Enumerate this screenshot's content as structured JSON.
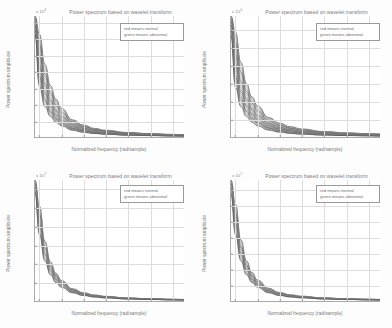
{
  "figure": {
    "layout": "2x2 subplot grid",
    "background_color": "#fdfdfd",
    "curve_color": "#4a4a4a",
    "grid_color": "#dcdcdc",
    "axis_color": "#a9a9a9",
    "text_color": "#7b7b7b"
  },
  "common": {
    "title": "Power spectrum based on wavelet transform",
    "xlabel": "Normalized frequency (rad/sample)",
    "ylabel": "Power spectrum amplitude",
    "legend": {
      "line1": "red means normal",
      "line2": "green means abnormal"
    }
  },
  "chart_data": [
    {
      "type": "line",
      "panel": "top-left",
      "title": "Power spectrum based on wavelet transform",
      "xlabel": "Normalized frequency (rad/sample)",
      "ylabel": "Power spectrum amplitude",
      "exponent_label": "x 10",
      "exponent_power": "4",
      "xticks": [
        "0.01",
        "0.02",
        "0.03",
        "0.04",
        "0.05",
        "0.06",
        "0.07"
      ],
      "xtick_values": [
        0.01,
        0.02,
        0.03,
        0.04,
        0.05,
        0.06,
        0.07
      ],
      "yticks": [
        "2",
        "4",
        "6",
        "8",
        "10",
        "12",
        "14"
      ],
      "ytick_values": [
        2,
        4,
        6,
        8,
        10,
        12,
        14
      ],
      "xlim": [
        0.008,
        0.0755
      ],
      "ylim": [
        0,
        14.8
      ],
      "grid": true,
      "legend_position": "upper right",
      "legend_entries": [
        "red means normal",
        "green means abnormal"
      ],
      "series_count": 22,
      "series_description": "Bundle of monotonically decaying power-law spectra, amplitude ~A/f^1.85",
      "x": [
        0.008,
        0.01,
        0.0125,
        0.015,
        0.0175,
        0.02,
        0.025,
        0.03,
        0.035,
        0.04,
        0.05,
        0.06,
        0.07,
        0.0755
      ],
      "series": [
        {
          "name": "normal-upper-envelope",
          "values": [
            14.8,
            12.6,
            8.9,
            6.3,
            4.6,
            3.5,
            2.1,
            1.45,
            1.05,
            0.82,
            0.55,
            0.41,
            0.32,
            0.28
          ]
        },
        {
          "name": "normal-median",
          "values": [
            14.2,
            10.4,
            6.8,
            4.7,
            3.4,
            2.6,
            1.6,
            1.1,
            0.8,
            0.62,
            0.42,
            0.31,
            0.25,
            0.22
          ]
        },
        {
          "name": "abnormal-median",
          "values": [
            13.4,
            8.2,
            5.1,
            3.5,
            2.5,
            1.9,
            1.15,
            0.8,
            0.58,
            0.45,
            0.31,
            0.23,
            0.18,
            0.16
          ]
        },
        {
          "name": "abnormal-lower-envelope",
          "values": [
            12.5,
            6.2,
            3.7,
            2.5,
            1.8,
            1.35,
            0.82,
            0.57,
            0.42,
            0.33,
            0.22,
            0.17,
            0.13,
            0.12
          ]
        }
      ]
    },
    {
      "type": "line",
      "panel": "top-right",
      "title": "Power spectrum based on wavelet transform",
      "xlabel": "Normalized frequency (rad/sample)",
      "ylabel": "Power spectrum amplitude",
      "exponent_label": "x 10",
      "exponent_power": "4",
      "xticks": [
        "0.01",
        "0.02",
        "0.03",
        "0.04",
        "0.05",
        "0.06",
        "0.07"
      ],
      "xtick_values": [
        0.01,
        0.02,
        0.03,
        0.04,
        0.05,
        0.06,
        0.07
      ],
      "yticks": [
        "2",
        "4",
        "6",
        "8",
        "10",
        "12"
      ],
      "ytick_values": [
        2,
        4,
        6,
        8,
        10,
        12
      ],
      "xlim": [
        0.008,
        0.0755
      ],
      "ylim": [
        0,
        13.6
      ],
      "grid": true,
      "legend_position": "upper right",
      "legend_entries": [
        "red means normal",
        "green means abnormal"
      ],
      "series_count": 22,
      "series_description": "Bundle of monotonically decaying power-law spectra, amplitude ~A/f^1.8",
      "x": [
        0.008,
        0.01,
        0.0125,
        0.015,
        0.0175,
        0.02,
        0.025,
        0.03,
        0.035,
        0.04,
        0.05,
        0.06,
        0.07,
        0.0755
      ],
      "series": [
        {
          "name": "normal-upper-envelope",
          "values": [
            13.6,
            11.8,
            8.4,
            6.0,
            4.5,
            3.5,
            2.2,
            1.55,
            1.15,
            0.9,
            0.62,
            0.47,
            0.38,
            0.34
          ]
        },
        {
          "name": "normal-median",
          "values": [
            13.1,
            9.7,
            6.5,
            4.5,
            3.3,
            2.55,
            1.6,
            1.12,
            0.83,
            0.65,
            0.45,
            0.34,
            0.27,
            0.24
          ]
        },
        {
          "name": "abnormal-median",
          "values": [
            12.4,
            7.6,
            4.8,
            3.3,
            2.4,
            1.85,
            1.15,
            0.81,
            0.6,
            0.47,
            0.32,
            0.24,
            0.19,
            0.17
          ]
        },
        {
          "name": "abnormal-lower-envelope",
          "values": [
            11.4,
            5.6,
            3.4,
            2.3,
            1.65,
            1.25,
            0.77,
            0.54,
            0.4,
            0.31,
            0.21,
            0.16,
            0.13,
            0.11
          ]
        }
      ]
    },
    {
      "type": "line",
      "panel": "bottom-left",
      "title": "Power spectrum based on wavelet transform",
      "xlabel": "Normalized frequency (rad/sample)",
      "ylabel": "Power spectrum amplitude",
      "exponent_label": "x 10",
      "exponent_power": "7",
      "xticks": [
        "0.01",
        "0.02",
        "0.03",
        "0.04",
        "0.05",
        "0.06",
        "0.07"
      ],
      "xtick_values": [
        0.01,
        0.02,
        0.03,
        0.04,
        0.05,
        0.06,
        0.07
      ],
      "yticks": [
        "0.5",
        "1",
        "1.5",
        "2",
        "2.5",
        "3"
      ],
      "ytick_values": [
        0.5,
        1,
        1.5,
        2,
        2.5,
        3
      ],
      "xlim": [
        0.008,
        0.0755
      ],
      "ylim": [
        0,
        3.25
      ],
      "grid": true,
      "legend_position": "upper right",
      "legend_entries": [
        "red means normal",
        "green means abnormal"
      ],
      "series_count": 14,
      "series_description": "Tight bundle of decaying power-law spectra, amplitude ~A/f^2",
      "x": [
        0.008,
        0.01,
        0.0125,
        0.015,
        0.0175,
        0.02,
        0.025,
        0.03,
        0.035,
        0.04,
        0.05,
        0.06,
        0.07,
        0.0755
      ],
      "series": [
        {
          "name": "normal-upper-envelope",
          "values": [
            3.25,
            2.55,
            1.6,
            1.05,
            0.74,
            0.55,
            0.33,
            0.22,
            0.16,
            0.125,
            0.082,
            0.06,
            0.047,
            0.042
          ]
        },
        {
          "name": "normal-median",
          "values": [
            3.15,
            2.3,
            1.42,
            0.93,
            0.66,
            0.49,
            0.29,
            0.195,
            0.142,
            0.11,
            0.072,
            0.053,
            0.041,
            0.037
          ]
        },
        {
          "name": "abnormal-median",
          "values": [
            3.05,
            2.05,
            1.25,
            0.82,
            0.58,
            0.43,
            0.26,
            0.172,
            0.125,
            0.097,
            0.064,
            0.047,
            0.036,
            0.033
          ]
        },
        {
          "name": "abnormal-lower-envelope",
          "values": [
            2.9,
            1.78,
            1.07,
            0.7,
            0.49,
            0.365,
            0.218,
            0.146,
            0.106,
            0.082,
            0.054,
            0.04,
            0.031,
            0.028
          ]
        }
      ]
    },
    {
      "type": "line",
      "panel": "bottom-right",
      "title": "Power spectrum based on wavelet transform",
      "xlabel": "Normalized frequency (rad/sample)",
      "ylabel": "Power spectrum amplitude",
      "exponent_label": "x 10",
      "exponent_power": "7",
      "xticks": [
        "0.01",
        "0.02",
        "0.03",
        "0.04",
        "0.05",
        "0.06",
        "0.07"
      ],
      "xtick_values": [
        0.01,
        0.02,
        0.03,
        0.04,
        0.05,
        0.06,
        0.07
      ],
      "yticks": [
        "0.5",
        "1",
        "1.5",
        "2",
        "2.5",
        "3",
        "3.5"
      ],
      "ytick_values": [
        0.5,
        1,
        1.5,
        2,
        2.5,
        3,
        3.5
      ],
      "xlim": [
        0.008,
        0.0755
      ],
      "ylim": [
        0,
        3.8
      ],
      "grid": true,
      "legend_position": "upper right",
      "legend_entries": [
        "red means normal",
        "green means abnormal"
      ],
      "series_count": 14,
      "series_description": "Tight bundle of decaying power-law spectra, amplitude ~A/f^2",
      "x": [
        0.008,
        0.01,
        0.0125,
        0.015,
        0.0175,
        0.02,
        0.025,
        0.03,
        0.035,
        0.04,
        0.05,
        0.06,
        0.07,
        0.0755
      ],
      "series": [
        {
          "name": "normal-upper-envelope",
          "values": [
            3.8,
            3.05,
            1.92,
            1.26,
            0.89,
            0.66,
            0.4,
            0.266,
            0.194,
            0.15,
            0.098,
            0.072,
            0.056,
            0.05
          ]
        },
        {
          "name": "normal-median",
          "values": [
            3.68,
            2.72,
            1.68,
            1.1,
            0.78,
            0.58,
            0.345,
            0.231,
            0.168,
            0.13,
            0.085,
            0.063,
            0.049,
            0.044
          ]
        },
        {
          "name": "abnormal-median",
          "values": [
            3.55,
            2.42,
            1.48,
            0.97,
            0.68,
            0.505,
            0.303,
            0.202,
            0.147,
            0.114,
            0.075,
            0.055,
            0.043,
            0.038
          ]
        },
        {
          "name": "abnormal-lower-envelope",
          "values": [
            3.35,
            2.08,
            1.26,
            0.82,
            0.58,
            0.43,
            0.257,
            0.172,
            0.125,
            0.097,
            0.064,
            0.047,
            0.036,
            0.033
          ]
        }
      ]
    }
  ]
}
